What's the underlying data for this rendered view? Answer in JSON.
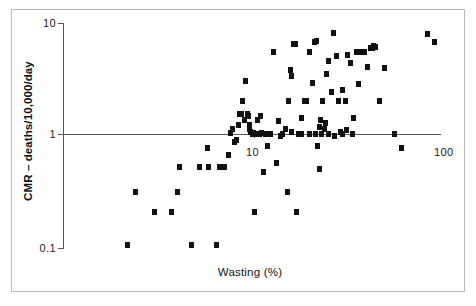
{
  "chart_data": {
    "type": "scatter",
    "title": "",
    "xlabel": "Wasting (%)",
    "ylabel": "CMR – deaths/10,000/day",
    "xscale": "log",
    "yscale": "log",
    "xlim": [
      2.0,
      110
    ],
    "ylim": [
      0.085,
      11
    ],
    "xticks": [
      10,
      100
    ],
    "xticklabels": [
      "10",
      "100"
    ],
    "yticks": [
      0.1,
      1,
      10
    ],
    "yticklabels": [
      "0.1",
      "1",
      "10"
    ],
    "grid": false,
    "legend": null,
    "marker": "square",
    "marker_color": "#111111",
    "points": [
      [
        2.1,
        0.1
      ],
      [
        2.3,
        0.3
      ],
      [
        2.9,
        0.2
      ],
      [
        3.6,
        0.2
      ],
      [
        3.9,
        0.3
      ],
      [
        4.0,
        0.5
      ],
      [
        4.6,
        0.1
      ],
      [
        5.1,
        0.5
      ],
      [
        5.6,
        0.75
      ],
      [
        5.7,
        0.5
      ],
      [
        6.3,
        0.1
      ],
      [
        6.5,
        0.5
      ],
      [
        6.9,
        0.5
      ],
      [
        7.3,
        0.65
      ],
      [
        7.5,
        1.02
      ],
      [
        7.7,
        1.1
      ],
      [
        7.9,
        0.85
      ],
      [
        8.1,
        0.88
      ],
      [
        8.3,
        1.2
      ],
      [
        8.4,
        1.5
      ],
      [
        8.5,
        1.5
      ],
      [
        8.7,
        2.0
      ],
      [
        8.9,
        1.35
      ],
      [
        9.0,
        3.0
      ],
      [
        9.2,
        1.5
      ],
      [
        9.3,
        1.45
      ],
      [
        9.5,
        1.2
      ],
      [
        9.6,
        1.05
      ],
      [
        9.8,
        1.0
      ],
      [
        9.9,
        1.02
      ],
      [
        10.0,
        0.2
      ],
      [
        10.2,
        1.0
      ],
      [
        10.4,
        1.35
      ],
      [
        10.7,
        1.0
      ],
      [
        10.9,
        1.45
      ],
      [
        11.2,
        0.45
      ],
      [
        11.5,
        1.0
      ],
      [
        11.8,
        0.78
      ],
      [
        12.3,
        1.0
      ],
      [
        12.8,
        5.5
      ],
      [
        13.2,
        0.55
      ],
      [
        13.6,
        1.3
      ],
      [
        14.2,
        1.0
      ],
      [
        14.8,
        1.1
      ],
      [
        15.1,
        0.3
      ],
      [
        15.4,
        2.0
      ],
      [
        15.8,
        3.8
      ],
      [
        16.0,
        3.3
      ],
      [
        16.4,
        6.5
      ],
      [
        16.8,
        6.5
      ],
      [
        17.0,
        0.2
      ],
      [
        17.4,
        1.0
      ],
      [
        17.9,
        1.4
      ],
      [
        18.6,
        2.0
      ],
      [
        19.2,
        2.0
      ],
      [
        20.0,
        5.5
      ],
      [
        20.6,
        2.9
      ],
      [
        21.2,
        6.8
      ],
      [
        21.8,
        6.9
      ],
      [
        22.0,
        0.78
      ],
      [
        22.4,
        0.48
      ],
      [
        22.6,
        1.15
      ],
      [
        22.8,
        1.35
      ],
      [
        23.4,
        2.0
      ],
      [
        24.0,
        1.1
      ],
      [
        24.6,
        3.5
      ],
      [
        25.2,
        4.5
      ],
      [
        26.0,
        2.4
      ],
      [
        26.8,
        8.2
      ],
      [
        27.6,
        5.0
      ],
      [
        28.4,
        2.0
      ],
      [
        29.2,
        1.05
      ],
      [
        30.0,
        2.5
      ],
      [
        31.0,
        2.0
      ],
      [
        32.0,
        5.2
      ],
      [
        33.0,
        4.4
      ],
      [
        34.4,
        1.4
      ],
      [
        35.6,
        5.5
      ],
      [
        36.4,
        2.8
      ],
      [
        38.0,
        5.5
      ],
      [
        39.2,
        5.5
      ],
      [
        41.0,
        4.0
      ],
      [
        42.4,
        5.9
      ],
      [
        43.2,
        6.0
      ],
      [
        44.0,
        6.2
      ],
      [
        45.0,
        6.1
      ],
      [
        47.0,
        2.0
      ],
      [
        50.0,
        3.9
      ],
      [
        57.0,
        1.0
      ],
      [
        62.0,
        0.75
      ],
      [
        86.0,
        8.0
      ],
      [
        93.0,
        6.8
      ],
      [
        8.6,
        1.5
      ],
      [
        9.4,
        1.1
      ],
      [
        10.1,
        1.0
      ],
      [
        10.6,
        1.0
      ],
      [
        11.0,
        1.02
      ],
      [
        13.9,
        0.95
      ],
      [
        15.9,
        1.05
      ],
      [
        18.0,
        1.0
      ],
      [
        19.8,
        1.0
      ],
      [
        21.5,
        1.0
      ],
      [
        23.0,
        1.0
      ],
      [
        24.2,
        1.25
      ],
      [
        25.0,
        1.0
      ],
      [
        27.0,
        0.95
      ],
      [
        29.8,
        1.0
      ],
      [
        31.5,
        1.08
      ],
      [
        34.0,
        1.0
      ]
    ],
    "_px": {
      "origin_x": 63,
      "origin_y": 134,
      "x10": 254,
      "x100": 440,
      "y10": 23,
      "y01": 248
    }
  }
}
